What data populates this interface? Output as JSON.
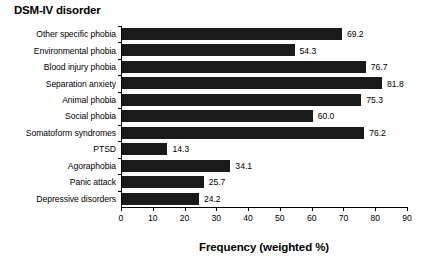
{
  "chart_data": {
    "type": "bar",
    "orientation": "horizontal",
    "title": "",
    "ylabel": "DSM-IV disorder",
    "xlabel": "Frequency (weighted %)",
    "xlim": [
      0,
      90
    ],
    "xticks": [
      0,
      10,
      20,
      30,
      40,
      50,
      60,
      70,
      80,
      90
    ],
    "grid": false,
    "legend": null,
    "bar_color": "#1a1a1a",
    "categories": [
      "Other specific phobia",
      "Environmental phobia",
      "Blood injury phobia",
      "Separation anxiety",
      "Animal phobia",
      "Social phobia",
      "Somatoform syndromes",
      "PTSD",
      "Agoraphobia",
      "Panic attack",
      "Depressive disorders"
    ],
    "values": [
      69.2,
      54.3,
      76.7,
      81.8,
      75.3,
      60.0,
      76.2,
      14.3,
      34.1,
      25.7,
      24.2
    ],
    "value_labels": [
      "69.2",
      "54.3",
      "76.7",
      "81.8",
      "75.3",
      "60.0",
      "76.2",
      "14.3",
      "34.1",
      "25.7",
      "24.2"
    ]
  }
}
